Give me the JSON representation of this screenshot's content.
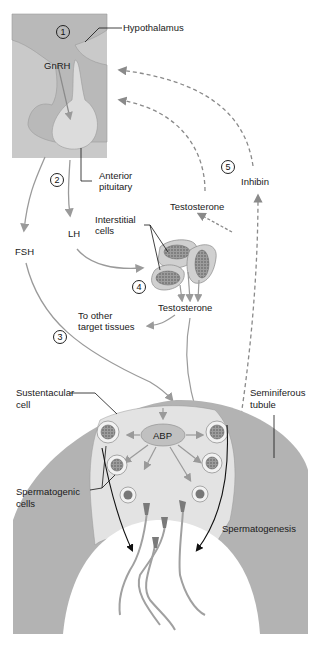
{
  "diagram": {
    "colors": {
      "brain_box": "#c9c9c9",
      "hypothalamus_fill": "#b9b9b9",
      "pituitary_fill": "#dcdcdc",
      "arrow_gray": "#9a9a9a",
      "tubule_wall": "#b3b3b3",
      "tubule_inner": "#e3e3e3",
      "lumen": "#ffffff",
      "line_black": "#111111"
    },
    "steps": [
      "1",
      "2",
      "3",
      "4",
      "5"
    ],
    "labels": {
      "hypothalamus": "Hypothalamus",
      "gnrh": "GnRH",
      "anterior_pituitary_line1": "Anterior",
      "anterior_pituitary_line2": "pituitary",
      "fsh": "FSH",
      "lh": "LH",
      "interstitial_cells_line1": "Interstitial",
      "interstitial_cells_line2": "cells",
      "testosterone_upper": "Testosterone",
      "testosterone_lower": "Testosterone",
      "inhibin": "Inhibin",
      "to_other_line1": "To other",
      "to_other_line2": "target tissues",
      "sustentacular_line1": "Sustentacular",
      "sustentacular_line2": "cell",
      "seminiferous_line1": "Seminiferous",
      "seminiferous_line2": "tubule",
      "abp": "ABP",
      "spermatogenic_line1": "Spermatogenic",
      "spermatogenic_line2": "cells",
      "spermatogenesis": "Spermatogenesis"
    }
  }
}
